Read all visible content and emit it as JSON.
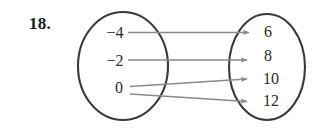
{
  "figure": {
    "problem_number": "18.",
    "type": "mapping-diagram",
    "domain_set": {
      "label": "domain",
      "values": [
        "−4",
        "−2",
        "0"
      ]
    },
    "range_set": {
      "label": "range",
      "values": [
        "6",
        "8",
        "10",
        "12"
      ]
    },
    "mappings": [
      {
        "from": "−4",
        "to": "6"
      },
      {
        "from": "−2",
        "to": "8"
      },
      {
        "from": "0",
        "to": "10"
      },
      {
        "from": "0",
        "to": "12"
      }
    ],
    "colors": {
      "background": "#ffffff",
      "ellipse_stroke": "#3a3a3a",
      "arrow_stroke": "#8a8a8a",
      "text": "#2a2a2a",
      "number_label": "#1a1a1a"
    }
  }
}
